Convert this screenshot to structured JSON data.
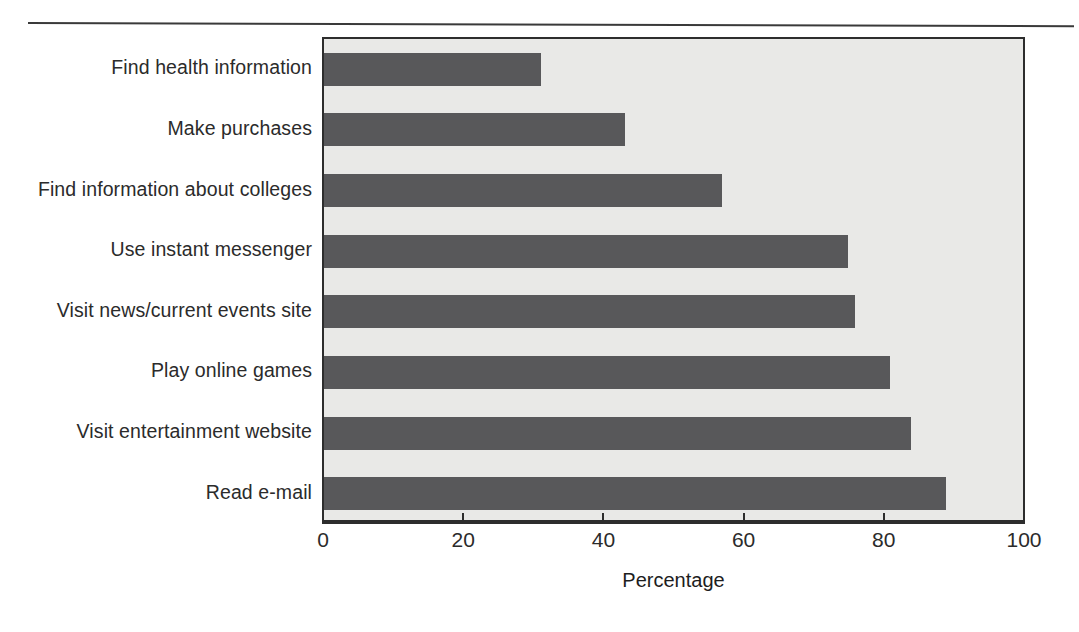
{
  "page": {
    "background_color": "#ffffff",
    "rule_color": "#3a3a3a"
  },
  "chart_data": {
    "type": "bar",
    "orientation": "horizontal",
    "title": "",
    "subtitle": "",
    "xlabel": "Percentage",
    "ylabel": "",
    "xlim": [
      0,
      100
    ],
    "ylim": null,
    "grid": false,
    "legend": null,
    "legend_position": "none",
    "bar_color": "#58585a",
    "plot_background_color": "#e9e9e7",
    "axis_color": "#2d2d2d",
    "xticks": [
      0,
      20,
      40,
      60,
      80,
      100
    ],
    "xtick_labels": [
      "0",
      "20",
      "40",
      "60",
      "80",
      "100"
    ],
    "categories": [
      "Find health information",
      "Make purchases",
      "Find information about colleges",
      "Use instant messenger",
      "Visit news/current events site",
      "Play online games",
      "Visit entertainment website",
      "Read e-mail"
    ],
    "values": [
      31,
      43,
      57,
      75,
      76,
      81,
      84,
      89
    ],
    "annotations": []
  }
}
